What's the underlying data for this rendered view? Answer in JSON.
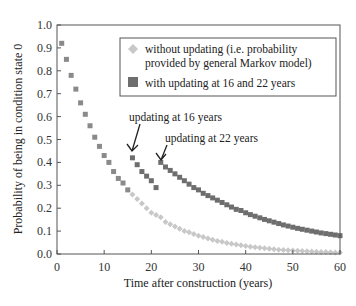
{
  "chart_data": {
    "type": "scatter",
    "title": "",
    "xlabel": "Time after construction (years)",
    "ylabel": "Probability of being in condition state 0",
    "xlim": [
      0,
      60
    ],
    "ylim": [
      0.0,
      1.0
    ],
    "xticks": [
      0,
      10,
      20,
      30,
      40,
      50,
      60
    ],
    "yticks": [
      "0.0",
      "0.1",
      "0.2",
      "0.3",
      "0.4",
      "0.5",
      "0.6",
      "0.7",
      "0.8",
      "0.9",
      "1.0"
    ],
    "grid": false,
    "legend_position": "upper right (inside)",
    "legend": [
      {
        "label_line1": "without updating (i.e. probability",
        "label_line2": "provided by general Markov model)",
        "marker": "diamond",
        "color": "#c8c8c8"
      },
      {
        "label_line1": "with updating at 16 and 22 years",
        "marker": "square",
        "color": "#6e6e6e"
      }
    ],
    "annotations": [
      {
        "text": "updating at 16 years",
        "arrow_to": [
          16,
          0.42
        ]
      },
      {
        "text": "updating at 22 years",
        "arrow_to": [
          22,
          0.4
        ]
      }
    ],
    "series": [
      {
        "name": "without updating (i.e. probability provided by general Markov model)",
        "marker": "diamond",
        "color": "#c8c8c8",
        "x": [
          1,
          2,
          3,
          4,
          5,
          6,
          7,
          8,
          9,
          10,
          11,
          12,
          13,
          14,
          15,
          16,
          17,
          18,
          19,
          20,
          21,
          22,
          23,
          24,
          25,
          26,
          27,
          28,
          29,
          30,
          31,
          32,
          33,
          34,
          35,
          36,
          37,
          38,
          39,
          40,
          41,
          42,
          43,
          44,
          45,
          46,
          47,
          48,
          49,
          50,
          51,
          52,
          53,
          54,
          55,
          56,
          57,
          58,
          59,
          60
        ],
        "y": [
          0.92,
          0.85,
          0.78,
          0.72,
          0.66,
          0.61,
          0.56,
          0.51,
          0.47,
          0.43,
          0.4,
          0.36,
          0.33,
          0.31,
          0.28,
          0.26,
          0.24,
          0.22,
          0.2,
          0.18,
          0.17,
          0.16,
          0.14,
          0.13,
          0.12,
          0.11,
          0.1,
          0.095,
          0.087,
          0.08,
          0.074,
          0.068,
          0.062,
          0.057,
          0.053,
          0.048,
          0.045,
          0.041,
          0.038,
          0.035,
          0.032,
          0.029,
          0.027,
          0.025,
          0.023,
          0.021,
          0.019,
          0.018,
          0.016,
          0.015,
          0.014,
          0.013,
          0.012,
          0.011,
          0.01,
          0.009,
          0.0085,
          0.008,
          0.007,
          0.0065
        ]
      },
      {
        "name": "with updating at 16 and 22 years",
        "marker": "square",
        "color": "#6e6e6e",
        "x": [
          1,
          2,
          3,
          4,
          5,
          6,
          7,
          8,
          9,
          10,
          11,
          12,
          13,
          14,
          15,
          16,
          17,
          18,
          19,
          20,
          21,
          22,
          23,
          24,
          25,
          26,
          27,
          28,
          29,
          30,
          31,
          32,
          33,
          34,
          35,
          36,
          37,
          38,
          39,
          40,
          41,
          42,
          43,
          44,
          45,
          46,
          47,
          48,
          49,
          50,
          51,
          52,
          53,
          54,
          55,
          56,
          57,
          58,
          59,
          60
        ],
        "y": [
          0.92,
          0.85,
          0.78,
          0.72,
          0.66,
          0.61,
          0.56,
          0.51,
          0.47,
          0.43,
          0.4,
          0.36,
          0.33,
          0.31,
          0.28,
          0.42,
          0.39,
          0.36,
          0.34,
          0.32,
          0.29,
          0.4,
          0.38,
          0.365,
          0.35,
          0.335,
          0.32,
          0.305,
          0.29,
          0.28,
          0.265,
          0.255,
          0.245,
          0.235,
          0.225,
          0.215,
          0.205,
          0.195,
          0.19,
          0.18,
          0.172,
          0.165,
          0.158,
          0.151,
          0.145,
          0.139,
          0.133,
          0.127,
          0.122,
          0.117,
          0.112,
          0.108,
          0.104,
          0.1,
          0.096,
          0.092,
          0.089,
          0.086,
          0.083,
          0.08
        ]
      }
    ]
  }
}
